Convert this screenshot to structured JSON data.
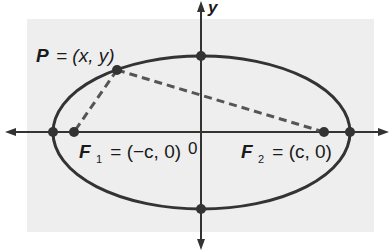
{
  "diagram": {
    "colors": {
      "background_panel": "#eeeeee",
      "stroke": "#333333",
      "text": "#1a1a1a"
    },
    "axes": {
      "x_label": "",
      "y_label": "y",
      "origin_label": "0"
    },
    "labels": {
      "P": "P",
      "P_eq": "= (x, y)",
      "F1": "F",
      "F1_sub": "1",
      "F1_eq": "= (−c, 0)",
      "F2": "F",
      "F2_sub": "2",
      "F2_eq": "= (c, 0)"
    },
    "points": [
      {
        "name": "P",
        "x": 117,
        "y": 70
      },
      {
        "name": "F1",
        "x": 74,
        "y": 132
      },
      {
        "name": "F2",
        "x": 324,
        "y": 132
      },
      {
        "name": "vertex-left",
        "x": 53,
        "y": 132
      },
      {
        "name": "vertex-right",
        "x": 350,
        "y": 132
      },
      {
        "name": "co-vertex-top",
        "x": 201,
        "y": 56
      },
      {
        "name": "co-vertex-bottom",
        "x": 201,
        "y": 209
      }
    ]
  }
}
